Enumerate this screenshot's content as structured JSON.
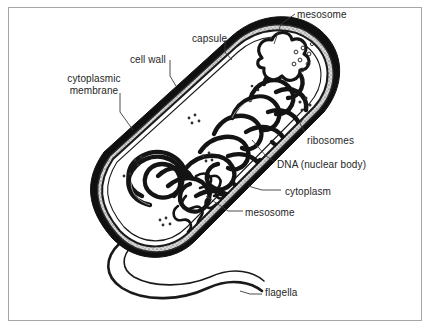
{
  "figure": {
    "type": "biology-diagram",
    "frame": {
      "border_color": "#a6a6a6",
      "background": "#ffffff"
    },
    "ink_color": "#1a1a1a"
  },
  "labels": [
    {
      "id": "mesosome-top",
      "text": "mesosome",
      "x": 297,
      "y": 9,
      "align": "left"
    },
    {
      "id": "capsule",
      "text": "capsule",
      "x": 192,
      "y": 33,
      "align": "left"
    },
    {
      "id": "cell-wall",
      "text": "cell wall",
      "x": 130,
      "y": 54,
      "align": "left"
    },
    {
      "id": "cytoplasmic-membrane",
      "text": "cytoplasmic\nmembrane",
      "x": 48,
      "y": 73,
      "align": "center"
    },
    {
      "id": "ribosomes",
      "text": "ribosomes",
      "x": 307,
      "y": 135,
      "align": "left"
    },
    {
      "id": "dna",
      "text": "DNA (nuclear body)",
      "x": 277,
      "y": 159,
      "align": "left"
    },
    {
      "id": "cytoplasm",
      "text": "cytoplasm",
      "x": 285,
      "y": 186,
      "align": "left"
    },
    {
      "id": "mesosome-bottom",
      "text": "mesosome",
      "x": 245,
      "y": 207,
      "align": "left"
    },
    {
      "id": "flagella",
      "text": "flagella",
      "x": 265,
      "y": 291,
      "align": "left"
    }
  ],
  "structures": [
    {
      "id": "capsule",
      "description": "outermost thick black band surrounding the cell"
    },
    {
      "id": "cell-wall",
      "description": "stippled grey layer inside the capsule"
    },
    {
      "id": "cytoplasmic-membrane",
      "description": "thin line layer inside the cell wall"
    },
    {
      "id": "cytoplasm",
      "description": "white interior of the cell"
    },
    {
      "id": "dna-nuclear-body",
      "description": "thick tangled looping strand filling the interior"
    },
    {
      "id": "ribosomes",
      "description": "small dot clusters scattered in the cytoplasm"
    },
    {
      "id": "mesosome-top",
      "description": "folded membrane invagination at the upper right end"
    },
    {
      "id": "mesosome-bottom",
      "description": "coiled folded membrane at the lower middle"
    },
    {
      "id": "flagella",
      "description": "long wavy tubular appendage from the lower left pole"
    }
  ]
}
